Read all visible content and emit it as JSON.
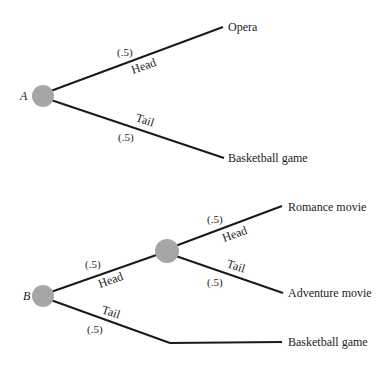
{
  "colors": {
    "node": "#a6a6a6",
    "line": "#1a1a1a",
    "text": "#222222"
  },
  "tree_a": {
    "root_label": "A",
    "head": {
      "label": "Head",
      "prob": "(.5)",
      "outcome": "Opera"
    },
    "tail": {
      "label": "Tail",
      "prob": "(.5)",
      "outcome": "Basketball game"
    }
  },
  "tree_b": {
    "root_label": "B",
    "head": {
      "label": "Head",
      "prob": "(.5)",
      "sub_head": {
        "label": "Head",
        "prob": "(.5)",
        "outcome": "Romance movie"
      },
      "sub_tail": {
        "label": "Tail",
        "prob": "(.5)",
        "outcome": "Adventure movie"
      }
    },
    "tail": {
      "label": "Tail",
      "prob": "(.5)",
      "outcome": "Basketball game"
    }
  }
}
